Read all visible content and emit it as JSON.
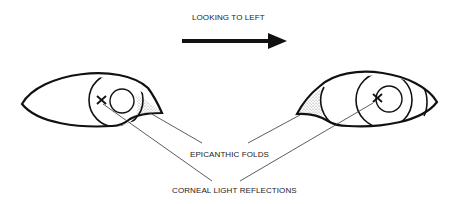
{
  "title": "LOOKING TO LEFT",
  "labels": {
    "epicanthic": "EPICANTHIC FOLDS",
    "corneal": "CORNEAL LIGHT REFLECTIONS"
  },
  "colors": {
    "line": "#1a1a1a",
    "background": "#ffffff",
    "stipple": "#8a8a8a"
  },
  "eyes": [
    {
      "side": "left",
      "fold_side": "inner-right",
      "reflection_marker": "x"
    },
    {
      "side": "right",
      "fold_side": "inner-left",
      "reflection_marker": "x"
    }
  ]
}
